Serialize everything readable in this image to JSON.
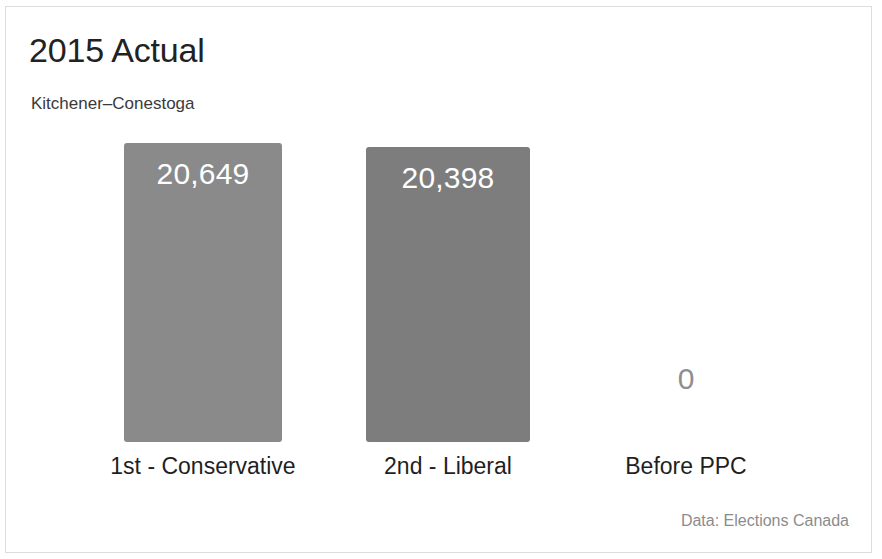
{
  "card": {
    "background": "#ffffff",
    "border_color": "#dcdcdc"
  },
  "header": {
    "title": "2015 Actual",
    "subtitle": "Kitchener–Conestoga"
  },
  "footer": {
    "data_source": "Data: Elections Canada"
  },
  "colors": {
    "bar_first": "#8a8a8a",
    "bar_second": "#7d7d7d",
    "value_label_on_bar": "#ffffff",
    "value_label_zero": "#8f8f8f",
    "category_label": "#1f1f1f",
    "title": "#222222",
    "subtitle": "#3a3a3a",
    "footnote": "#8c8c8c"
  },
  "chart_data": {
    "type": "bar",
    "title": "2015 Actual",
    "subtitle": "Kitchener–Conestoga",
    "xlabel": "",
    "ylabel": "",
    "grid": false,
    "legend": false,
    "ylim": [
      0,
      21500
    ],
    "source": "Data: Elections Canada",
    "categories": [
      "1st - Conservative",
      "2nd - Liberal",
      "Before PPC"
    ],
    "values": [
      20649,
      20398,
      0
    ],
    "value_labels": [
      "20,649",
      "20,398",
      "0"
    ],
    "bars": [
      {
        "category": "1st - Conservative",
        "value": 20649,
        "value_label": "20,649",
        "color": "#8a8a8a",
        "label_inside_bar": true
      },
      {
        "category": "2nd - Liberal",
        "value": 20398,
        "value_label": "20,398",
        "color": "#7d7d7d",
        "label_inside_bar": true
      },
      {
        "category": "Before PPC",
        "value": 0,
        "value_label": "0",
        "color": "none",
        "label_inside_bar": false
      }
    ]
  }
}
